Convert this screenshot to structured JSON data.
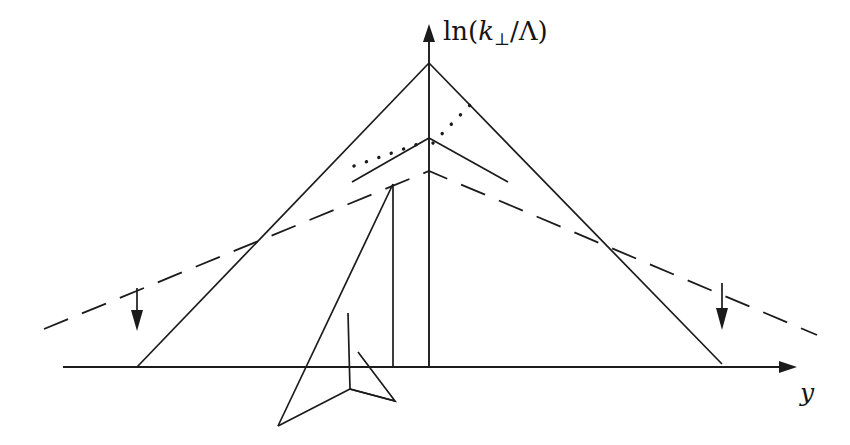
{
  "figure": {
    "kind": "line-diagram",
    "background_color": "#ffffff",
    "ink_color": "#1b1b1b",
    "width": 850,
    "height": 445
  },
  "axes": {
    "y_axis": {
      "name": "vertical-axis",
      "label_parts": {
        "ln": "ln(",
        "k": "k",
        "perp": "⊥",
        "slash": "/",
        "lambda": "Λ",
        "close": ")"
      },
      "label_plain": "ln(k⊥/Λ)",
      "x": 429,
      "top_y": 24,
      "bottom_y": 367
    },
    "x_axis": {
      "name": "horizontal-axis",
      "label_plain": "y",
      "y": 367,
      "left_x": 63,
      "tip_x": 797
    }
  },
  "elements": {
    "outer_cascade": {
      "name": "outer-cascade-triangle",
      "apex": [
        429,
        63
      ],
      "left_foot": [
        137,
        367
      ],
      "right_foot": [
        722,
        364
      ]
    },
    "inner_cascade": {
      "name": "inner-cascade-vee",
      "apex": [
        429,
        138
      ],
      "left_end": [
        352,
        182
      ],
      "right_end": [
        508,
        182
      ]
    },
    "dashed_envelope": {
      "name": "dashed-envelope",
      "left_end": [
        44,
        329
      ],
      "peak": [
        429,
        171
      ],
      "right_end": [
        817,
        335
      ]
    },
    "dotted_left": {
      "name": "dotted-segment-left",
      "from": [
        354,
        165
      ],
      "to": [
        424,
        142
      ]
    },
    "dotted_right": {
      "name": "dotted-segment-right",
      "from": [
        432,
        142
      ],
      "to": [
        471,
        104
      ]
    },
    "emission_arrow_left": {
      "name": "downward-arrow-left",
      "x": 137,
      "from_y": 288,
      "to_y": 330
    },
    "emission_arrow_right": {
      "name": "downward-arrow-right",
      "x": 722,
      "from_y": 283,
      "to_y": 330
    },
    "subjet_spike": {
      "name": "subjet-spike",
      "top": [
        393,
        184
      ],
      "bottom": [
        393,
        367
      ],
      "slant_to": [
        278,
        426
      ]
    },
    "subjet_arrowhead": {
      "name": "subjet-arrowhead",
      "points": [
        [
          348,
          313
        ],
        [
          350,
          389
        ],
        [
          395,
          401
        ],
        [
          358,
          353
        ]
      ]
    }
  }
}
